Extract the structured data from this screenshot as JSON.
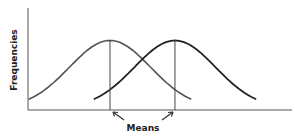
{
  "diagram": {
    "y_axis_label": "Frequencies",
    "annotation_label": "Means",
    "curves": [
      {
        "name": "distribution-1",
        "mean": 0.0,
        "sd": 1.0,
        "color": "#555555"
      },
      {
        "name": "distribution-2",
        "mean": 1.6,
        "sd": 1.0,
        "color": "#222222"
      }
    ]
  }
}
